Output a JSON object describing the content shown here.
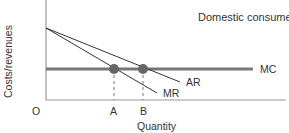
{
  "diagram": {
    "title": "Domestic consumers",
    "y_axis_label": "Costs/revenues",
    "x_axis_label": "Quantity",
    "origin_label": "O",
    "curves": [
      {
        "name": "AR",
        "label": "AR",
        "description": "Average revenue (demand) curve, downward sloping"
      },
      {
        "name": "MR",
        "label": "MR",
        "description": "Marginal revenue curve, steeper downward slope"
      },
      {
        "name": "MC",
        "label": "MC",
        "description": "Marginal cost, horizontal line"
      }
    ],
    "quantity_markers": [
      {
        "label": "A",
        "description": "MR = MC intersection"
      },
      {
        "label": "B",
        "description": "AR = MC intersection"
      }
    ],
    "colors": {
      "axis": "#999999",
      "mc_line": "#777777",
      "curve_lines": "#333333",
      "points": "#666666"
    }
  }
}
